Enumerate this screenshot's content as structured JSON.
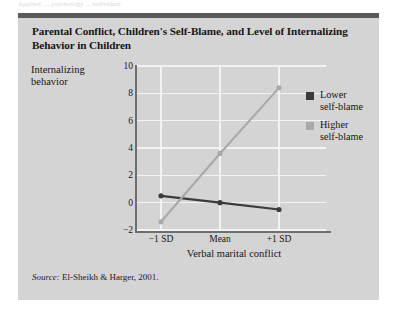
{
  "page": {
    "top_cut_text": "Applied: ... psychology ... individual"
  },
  "figure": {
    "title": "Parental Conflict, Children's Self-Blame, and Level of Internalizing Behavior in Children",
    "source_prefix": "Source:",
    "source_text": "El-Sheikh & Harger, 2001."
  },
  "legend": {
    "position": "right",
    "items": [
      {
        "label_line1": "Lower",
        "label_line2": "self-blame",
        "color": "#3b3b3b"
      },
      {
        "label_line1": "Higher",
        "label_line2": "self-blame",
        "color": "#a9a9a9"
      }
    ]
  },
  "chart_data": {
    "type": "line",
    "title": "Parental Conflict, Children's Self-Blame, and Level of Internalizing Behavior in Children",
    "xlabel": "Verbal marital conflict",
    "ylabel": "Internalizing behavior",
    "ylabel_line1": "Internalizing",
    "ylabel_line2": "behavior",
    "categories": [
      "-1 SD",
      "Mean",
      "+1 SD"
    ],
    "ylim": [
      -2,
      10
    ],
    "yticks": [
      -2,
      0,
      2,
      4,
      6,
      8,
      10
    ],
    "ytick_labels": [
      "-2",
      "0",
      "2",
      "4",
      "6",
      "8",
      "10"
    ],
    "grid": true,
    "grid_color": "#f2f2f2",
    "plot_bg": "#d4d4d4",
    "axis_color": "#6e6e6e",
    "series": [
      {
        "name": "Lower self-blame",
        "color": "#3b3b3b",
        "values": [
          0.5,
          0.0,
          -0.5
        ],
        "marker": "circle"
      },
      {
        "name": "Higher self-blame",
        "color": "#a9a9a9",
        "values": [
          -1.4,
          3.6,
          8.4
        ],
        "marker": "circle"
      }
    ]
  }
}
